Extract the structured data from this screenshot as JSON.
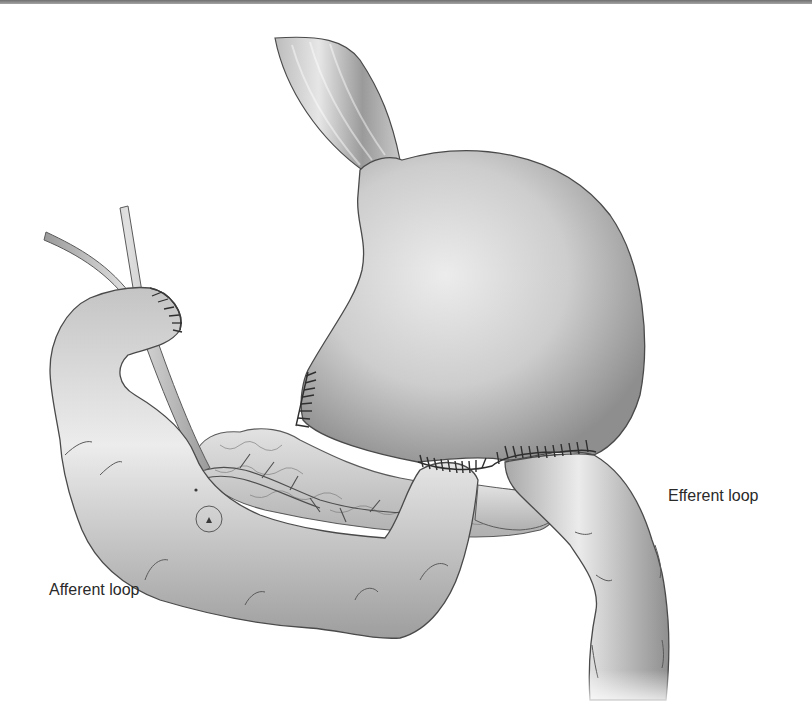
{
  "figure": {
    "palette": {
      "background": "#ffffff",
      "organ_light": "#e8e8e8",
      "organ_mid": "#bdbdbd",
      "organ_dark": "#8a8a8a",
      "outline": "#4a4a4a",
      "suture": "#2e2e2e",
      "top_rule": "#7a7a7a"
    },
    "labels": {
      "afferent": "Afferent loop",
      "efferent": "Efferent loop"
    }
  }
}
